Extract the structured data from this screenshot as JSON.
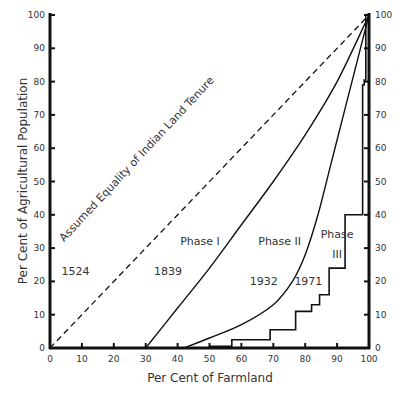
{
  "chart_data": {
    "type": "line",
    "title": "",
    "xlabel": "Per Cent of Farmland",
    "ylabel": "Per Cent of Agricultural Population",
    "xlim": [
      0,
      100
    ],
    "ylim": [
      0,
      100
    ],
    "x_ticks": [
      0,
      10,
      20,
      30,
      40,
      50,
      60,
      70,
      80,
      90,
      100
    ],
    "y_ticks": [
      0,
      10,
      20,
      30,
      40,
      50,
      60,
      70,
      80,
      90,
      100
    ],
    "grid": false,
    "series": [
      {
        "name": "1524",
        "style": "dashed",
        "points": [
          [
            0,
            0
          ],
          [
            100,
            100
          ]
        ]
      },
      {
        "name": "1839",
        "style": "solid",
        "points": [
          [
            30,
            0
          ],
          [
            40,
            12
          ],
          [
            50,
            24
          ],
          [
            60,
            37
          ],
          [
            70,
            50
          ],
          [
            80,
            64
          ],
          [
            90,
            80
          ],
          [
            100,
            100
          ]
        ]
      },
      {
        "name": "1932",
        "style": "solid",
        "points": [
          [
            42,
            0
          ],
          [
            50,
            3
          ],
          [
            60,
            7
          ],
          [
            70,
            13
          ],
          [
            76,
            20
          ],
          [
            80,
            28
          ],
          [
            84,
            40
          ],
          [
            88,
            55
          ],
          [
            92,
            70
          ],
          [
            96,
            85
          ],
          [
            100,
            100
          ]
        ]
      },
      {
        "name": "1971",
        "style": "step",
        "points": [
          [
            50,
            0.5
          ],
          [
            57,
            0.5
          ],
          [
            57,
            2.5
          ],
          [
            69,
            2.5
          ],
          [
            69,
            5.5
          ],
          [
            77,
            5.5
          ],
          [
            77,
            11
          ],
          [
            82,
            11
          ],
          [
            82,
            13
          ],
          [
            84.5,
            13
          ],
          [
            84.5,
            16
          ],
          [
            87.5,
            16
          ],
          [
            87.5,
            24
          ],
          [
            92.5,
            24
          ],
          [
            92.5,
            40
          ],
          [
            98,
            40
          ],
          [
            98,
            79
          ],
          [
            98.5,
            79
          ],
          [
            98.5,
            80.5
          ],
          [
            99,
            80.5
          ],
          [
            99,
            100
          ]
        ]
      }
    ],
    "annotations": [
      {
        "text": "Assumed Equality of Indian Land Tenure",
        "x": 28,
        "y": 56,
        "rotate": -47
      },
      {
        "text": "Phase I",
        "x": 47,
        "y": 31
      },
      {
        "text": "Phase II",
        "x": 72,
        "y": 31
      },
      {
        "text": "Phase",
        "x": 90,
        "y": 33
      },
      {
        "text": "III",
        "x": 90,
        "y": 27
      },
      {
        "text": "1524",
        "x": 8,
        "y": 22
      },
      {
        "text": "1839",
        "x": 37,
        "y": 22
      },
      {
        "text": "1932",
        "x": 67,
        "y": 19
      },
      {
        "text": "1971",
        "x": 81,
        "y": 19
      }
    ]
  }
}
